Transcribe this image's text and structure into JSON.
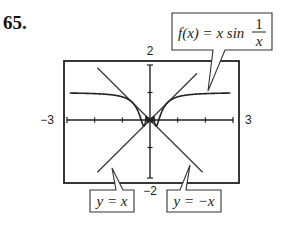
{
  "problem_number": "65.",
  "chart_data": {
    "type": "line",
    "title": "",
    "xlabel": "",
    "ylabel": "",
    "xlim": [
      -3,
      3
    ],
    "ylim": [
      -2,
      2
    ],
    "tick_labels": {
      "xmin": "−3",
      "xmax": "3",
      "ymin": "−2",
      "ymax": "2"
    },
    "x_ticks": [
      -2,
      -1,
      1,
      2
    ],
    "y_ticks": [
      -1,
      1
    ],
    "grid": false,
    "series": [
      {
        "name": "f(x) = x sin(1/x)",
        "function": "x*sin(1/x)",
        "style": "solid"
      },
      {
        "name": "y = x",
        "function": "x",
        "style": "solid",
        "x_range": [
          -1.9,
          1.7
        ]
      },
      {
        "name": "y = -x",
        "function": "-x",
        "style": "solid",
        "x_range": [
          -1.9,
          1.9
        ]
      }
    ],
    "annotations": [
      {
        "text": "f(x) = x sin 1/x",
        "points_to": "f(x) curve near x = 1.3"
      },
      {
        "text": "y = x",
        "points_to": "y = x line near x = -1.3"
      },
      {
        "text": "y = -x",
        "points_to": "y = -x line near x = 1.3"
      }
    ]
  },
  "callouts": {
    "f_label_lhs": "f(x) = x sin",
    "f_label_num": "1",
    "f_label_den": "x",
    "yx_label": "y = x",
    "ynegx_label": "y = −x"
  }
}
